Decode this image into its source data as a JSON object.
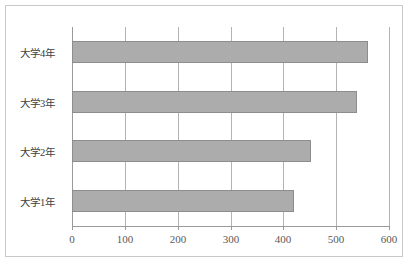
{
  "chart_data": {
    "type": "bar",
    "orientation": "horizontal",
    "title": "",
    "subtitle": "",
    "xlabel": "",
    "ylabel": "",
    "categories": [
      "大学1年",
      "大学2年",
      "大学3年",
      "大学4年"
    ],
    "values": [
      421,
      453,
      540,
      560
    ],
    "series": [
      {
        "name": "",
        "values": [
          421,
          453,
          540,
          560
        ]
      }
    ],
    "xlim": [
      0,
      600
    ],
    "x_ticks": [
      0,
      100,
      200,
      300,
      400,
      500,
      600
    ],
    "x_tick_labels": [
      "0",
      "100",
      "200",
      "300",
      "400",
      "500",
      "600"
    ],
    "grid": true,
    "grid_axis": "x",
    "legend": false,
    "legend_position": "none",
    "colors": {
      "bar_fill": "#acacac",
      "bar_border": "#8d8d8d",
      "gridline": "#b3b3b3",
      "axis": "#9a9a9a",
      "frame_border": "#c9c9c9",
      "label_text": "#404040",
      "tick_text": "#595959",
      "background": "#ffffff"
    }
  }
}
